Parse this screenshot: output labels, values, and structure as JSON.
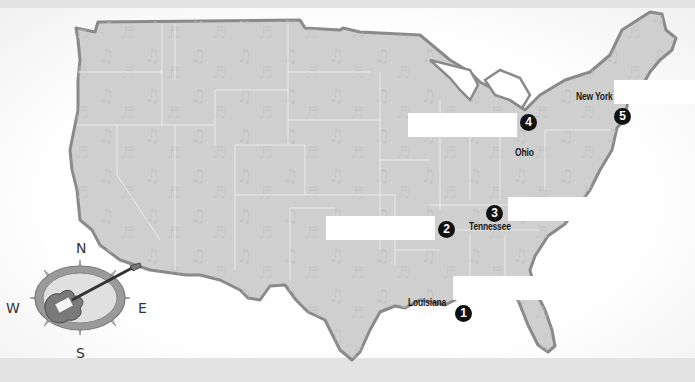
{
  "map": {
    "title": "United States music map",
    "markers": [
      {
        "number": "1",
        "x": 455,
        "y": 362
      },
      {
        "number": "2",
        "x": 440,
        "y": 221
      },
      {
        "number": "3",
        "x": 487,
        "y": 206
      },
      {
        "number": "4",
        "x": 520,
        "y": 116
      },
      {
        "number": "5",
        "x": 617,
        "y": 110
      }
    ],
    "state_labels": [
      {
        "name": "Louisiana",
        "x": 408,
        "y": 300
      },
      {
        "name": "Tennessee",
        "x": 469,
        "y": 221
      },
      {
        "name": "Ohio",
        "x": 515,
        "y": 147
      },
      {
        "name": "New York",
        "x": 575,
        "y": 92
      }
    ],
    "label_boxes": [
      {
        "id": "box-1",
        "x": 453,
        "y": 276,
        "w": 108,
        "h": 24
      },
      {
        "id": "box-2",
        "x": 326,
        "y": 216,
        "w": 109,
        "h": 24
      },
      {
        "id": "box-3",
        "x": 508,
        "y": 197,
        "w": 110,
        "h": 24
      },
      {
        "id": "box-4",
        "x": 408,
        "y": 113,
        "w": 109,
        "h": 24
      },
      {
        "id": "box-5",
        "x": 614,
        "y": 80,
        "w": 81,
        "h": 24
      }
    ],
    "compass": {
      "north": "N",
      "south": "S",
      "east": "E",
      "west": "W",
      "center_icon": "electric-guitar-icon"
    },
    "colors": {
      "land": "#cfcfcf",
      "border": "#8a8a8a",
      "state_lines": "#e8e8e8",
      "marker": "#111111",
      "label_box": "#ffffff"
    }
  }
}
